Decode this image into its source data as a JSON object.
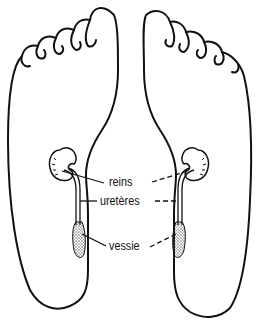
{
  "diagram": {
    "labels": {
      "kidneys": "reins",
      "ureters": "uretères",
      "bladder": "vessie"
    },
    "colors": {
      "stroke": "#111111",
      "background": "#ffffff",
      "stipple": "#555555"
    }
  }
}
